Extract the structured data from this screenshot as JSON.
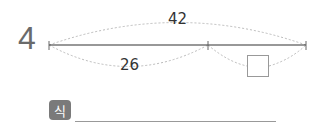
{
  "problem": {
    "number": "4",
    "total_label": "42",
    "part_label": "26",
    "unknown_box": "",
    "formula_badge": "식",
    "formula_answer": ""
  }
}
